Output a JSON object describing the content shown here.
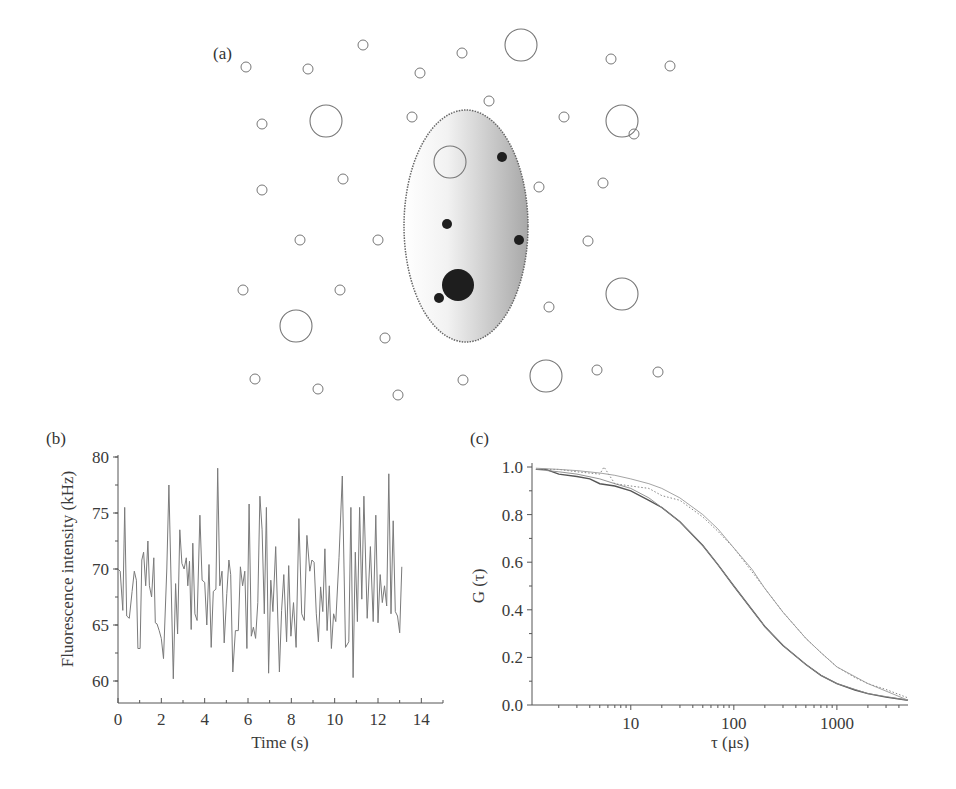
{
  "figure": {
    "panel_labels": {
      "a": "(a)",
      "b": "(b)",
      "c": "(c)"
    }
  },
  "diagram_a": {
    "description": "Confocal observation volume (shaded ellipse) with diffusing particles",
    "ellipse": {
      "cx": 466,
      "cy": 226,
      "rx": 62,
      "ry": 116
    },
    "open_circles": [
      {
        "x": 246,
        "y": 67,
        "r": 5
      },
      {
        "x": 308,
        "y": 69,
        "r": 5
      },
      {
        "x": 420,
        "y": 73,
        "r": 5
      },
      {
        "x": 462,
        "y": 53,
        "r": 5
      },
      {
        "x": 521,
        "y": 45,
        "r": 16
      },
      {
        "x": 611,
        "y": 59,
        "r": 5
      },
      {
        "x": 670,
        "y": 66,
        "r": 5
      },
      {
        "x": 363,
        "y": 45,
        "r": 5
      },
      {
        "x": 489,
        "y": 101,
        "r": 5
      },
      {
        "x": 412,
        "y": 117,
        "r": 5
      },
      {
        "x": 326,
        "y": 121,
        "r": 16
      },
      {
        "x": 262,
        "y": 124,
        "r": 5
      },
      {
        "x": 564,
        "y": 117,
        "r": 5
      },
      {
        "x": 622,
        "y": 121,
        "r": 16
      },
      {
        "x": 634,
        "y": 134,
        "r": 5
      },
      {
        "x": 450,
        "y": 162,
        "r": 16
      },
      {
        "x": 262,
        "y": 190,
        "r": 5
      },
      {
        "x": 343,
        "y": 179,
        "r": 5
      },
      {
        "x": 539,
        "y": 187,
        "r": 5
      },
      {
        "x": 603,
        "y": 183,
        "r": 5
      },
      {
        "x": 300,
        "y": 240,
        "r": 5
      },
      {
        "x": 378,
        "y": 240,
        "r": 5
      },
      {
        "x": 588,
        "y": 241,
        "r": 5
      },
      {
        "x": 243,
        "y": 290,
        "r": 5
      },
      {
        "x": 340,
        "y": 290,
        "r": 5
      },
      {
        "x": 622,
        "y": 294,
        "r": 16
      },
      {
        "x": 549,
        "y": 307,
        "r": 5
      },
      {
        "x": 296,
        "y": 326,
        "r": 16
      },
      {
        "x": 385,
        "y": 338,
        "r": 5
      },
      {
        "x": 255,
        "y": 379,
        "r": 5
      },
      {
        "x": 318,
        "y": 389,
        "r": 5
      },
      {
        "x": 398,
        "y": 395,
        "r": 5
      },
      {
        "x": 463,
        "y": 380,
        "r": 5
      },
      {
        "x": 546,
        "y": 376,
        "r": 16
      },
      {
        "x": 597,
        "y": 370,
        "r": 5
      },
      {
        "x": 658,
        "y": 372,
        "r": 5
      }
    ],
    "filled_circles": [
      {
        "x": 502,
        "y": 157,
        "r": 5
      },
      {
        "x": 447,
        "y": 224,
        "r": 5
      },
      {
        "x": 519,
        "y": 240,
        "r": 5
      },
      {
        "x": 458,
        "y": 285,
        "r": 16
      },
      {
        "x": 439,
        "y": 298,
        "r": 5
      }
    ]
  },
  "chart_data": [
    {
      "panel": "(b)",
      "type": "line",
      "title": "",
      "xlabel": "Time (s)",
      "ylabel": "Fluorescence intensity (kHz)",
      "xlim": [
        0,
        15
      ],
      "ylim": [
        58,
        80
      ],
      "xticks": [
        "0",
        "2",
        "4",
        "6",
        "8",
        "10",
        "12",
        "14"
      ],
      "yticks": [
        "60",
        "65",
        "70",
        "75",
        "80"
      ],
      "grid": false,
      "series": [
        {
          "name": "intensity trace",
          "color": "#777777",
          "x": [
            0,
            0.1,
            0.22,
            0.31,
            0.4,
            0.52,
            0.65,
            0.75,
            0.85,
            0.92,
            1.02,
            1.1,
            1.18,
            1.28,
            1.38,
            1.45,
            1.55,
            1.65,
            1.72,
            1.8,
            1.9,
            2.0,
            2.1,
            2.25,
            2.35,
            2.55,
            2.66,
            2.75,
            2.85,
            2.95,
            3.05,
            3.15,
            3.22,
            3.3,
            3.38,
            3.45,
            3.55,
            3.65,
            3.78,
            3.88,
            4.0,
            4.1,
            4.2,
            4.3,
            4.4,
            4.52,
            4.6,
            4.7,
            4.8,
            4.9,
            5.02,
            5.12,
            5.2,
            5.3,
            5.42,
            5.55,
            5.65,
            5.75,
            5.85,
            5.95,
            6.05,
            6.15,
            6.25,
            6.35,
            6.45,
            6.55,
            6.65,
            6.75,
            6.85,
            6.95,
            7.05,
            7.15,
            7.28,
            7.45,
            7.55,
            7.65,
            7.78,
            7.88,
            7.98,
            8.1,
            8.22,
            8.35,
            8.48,
            8.6,
            8.72,
            8.85,
            8.95,
            9.05,
            9.15,
            9.25,
            9.35,
            9.45,
            9.55,
            9.65,
            9.75,
            9.85,
            9.95,
            10.05,
            10.2,
            10.35,
            10.5,
            10.65,
            10.75,
            10.85,
            10.95,
            11.05,
            11.15,
            11.25,
            11.35,
            11.5,
            11.65,
            11.78,
            11.9,
            12.0,
            12.1,
            12.2,
            12.3,
            12.4,
            12.5,
            12.6,
            12.7,
            12.8,
            12.9,
            13.0,
            13.1,
            13.2,
            13.3,
            13.42,
            13.52,
            13.62,
            13.72,
            13.82,
            13.92,
            14.02,
            14.12,
            14.22,
            14.32,
            14.42,
            14.55,
            14.7,
            14.85,
            15.0
          ],
          "values": [
            70,
            69.8,
            66.3,
            75.5,
            65.8,
            65.6,
            68,
            69.8,
            69,
            62.9,
            62.9,
            70.8,
            71.5,
            68.5,
            72.5,
            68.5,
            67.5,
            71,
            65.2,
            65.1,
            64.5,
            63.8,
            62,
            70,
            77.5,
            60.2,
            68.7,
            64.2,
            73.5,
            70.5,
            70,
            71,
            68.5,
            70.7,
            64.6,
            72.3,
            66,
            65.4,
            74.8,
            69,
            68.8,
            65,
            70.4,
            63,
            68,
            68.2,
            79,
            68.5,
            69.8,
            63.4,
            67.8,
            70.8,
            69.5,
            60.8,
            64.5,
            64.5,
            70.2,
            68.5,
            69.8,
            62.9,
            75.8,
            64,
            64.8,
            63.8,
            67,
            76.5,
            73.5,
            66,
            75.5,
            60.7,
            69,
            66.2,
            72,
            60.8,
            66.3,
            69.5,
            63.5,
            70.3,
            64,
            67,
            63,
            74.5,
            66,
            65.4,
            73,
            69.8,
            70.8,
            70.6,
            66,
            63.5,
            68.4,
            66.2,
            71.8,
            64.5,
            68.5,
            62.9,
            66,
            65.3,
            71,
            78.3,
            63,
            63.5,
            75.5,
            60.3,
            71.5,
            65.3,
            75.5,
            67.3,
            76.5,
            65.6,
            72,
            65.3,
            74.8,
            65.2,
            69.5,
            67,
            68.5,
            66.7,
            78.5,
            66,
            74.3,
            66.2,
            65.8,
            64.3,
            70.2
          ]
        }
      ]
    },
    {
      "panel": "(c)",
      "type": "line",
      "title": "",
      "xlabel": "τ (μs)",
      "ylabel": "G (τ)",
      "xscale": "log",
      "xlim": [
        1.1,
        4900
      ],
      "ylim": [
        0.0,
        1.0
      ],
      "xticks": [
        "10",
        "100",
        "1000"
      ],
      "yticks": [
        "0.0",
        "0.2",
        "0.4",
        "0.6",
        "0.8",
        "1.0"
      ],
      "grid": false,
      "series": [
        {
          "name": "data (fast, τD≈100 μs)",
          "style": "solid",
          "color": "#555555",
          "x": [
            1.2,
            1.5,
            2,
            3,
            4,
            5,
            7,
            10,
            15,
            20,
            30,
            50,
            70,
            100,
            150,
            200,
            300,
            500,
            700,
            1000,
            1500,
            2000,
            3000,
            4900
          ],
          "values": [
            0.99,
            0.99,
            0.97,
            0.96,
            0.95,
            0.93,
            0.92,
            0.9,
            0.86,
            0.83,
            0.77,
            0.67,
            0.59,
            0.5,
            0.4,
            0.33,
            0.25,
            0.17,
            0.125,
            0.09,
            0.063,
            0.048,
            0.033,
            0.02
          ]
        },
        {
          "name": "fit (fast)",
          "style": "thin",
          "color": "#888888",
          "x": [
            1.2,
            2,
            3,
            5,
            7,
            10,
            15,
            20,
            30,
            50,
            70,
            100,
            150,
            200,
            300,
            500,
            700,
            1000,
            2000,
            4900
          ],
          "values": [
            0.99,
            0.98,
            0.97,
            0.95,
            0.93,
            0.91,
            0.87,
            0.83,
            0.77,
            0.67,
            0.59,
            0.5,
            0.4,
            0.33,
            0.25,
            0.17,
            0.125,
            0.09,
            0.048,
            0.02
          ]
        },
        {
          "name": "data (slow, τD≈195 μs)",
          "style": "dotted",
          "color": "#777777",
          "x": [
            1.2,
            2,
            3,
            5,
            5.5,
            7,
            10,
            15,
            20,
            30,
            50,
            70,
            100,
            150,
            200,
            300,
            500,
            700,
            1000,
            1500,
            2000,
            3000,
            4900
          ],
          "values": [
            0.99,
            0.99,
            0.98,
            0.97,
            1.0,
            0.93,
            0.92,
            0.91,
            0.88,
            0.86,
            0.79,
            0.73,
            0.66,
            0.56,
            0.49,
            0.39,
            0.28,
            0.22,
            0.16,
            0.115,
            0.09,
            0.065,
            0.03
          ]
        },
        {
          "name": "fit (slow)",
          "style": "thin",
          "color": "#999999",
          "x": [
            1.2,
            2,
            3,
            5,
            7,
            10,
            15,
            20,
            30,
            50,
            70,
            100,
            150,
            200,
            300,
            500,
            700,
            1000,
            2000,
            4900
          ],
          "values": [
            0.995,
            0.99,
            0.985,
            0.975,
            0.965,
            0.95,
            0.93,
            0.91,
            0.87,
            0.8,
            0.74,
            0.66,
            0.57,
            0.49,
            0.39,
            0.28,
            0.22,
            0.16,
            0.09,
            0.02
          ]
        }
      ]
    }
  ]
}
